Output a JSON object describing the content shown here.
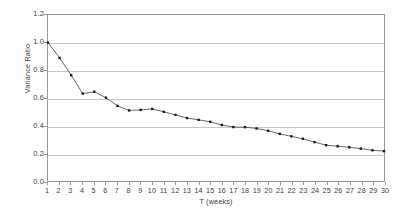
{
  "chart_data": {
    "type": "line",
    "title": "",
    "xlabel": "T (weeks)",
    "ylabel": "Variance Ratio",
    "xlim": [
      1,
      30
    ],
    "ylim": [
      0.0,
      1.2
    ],
    "grid": true,
    "legend": "none",
    "marker": "square",
    "x_tick_labels": [
      "1",
      "2",
      "3",
      "4",
      "5",
      "6",
      "7",
      "8",
      "9",
      "10",
      "11",
      "12",
      "13",
      "14",
      "15",
      "16",
      "17",
      "18",
      "19",
      "20",
      "21",
      "22",
      "23",
      "24",
      "25",
      "26",
      "27",
      "28",
      "29",
      "30"
    ],
    "y_tick_labels": [
      "0.0",
      "0.2",
      "0.4",
      "0.6",
      "0.8",
      "1.0",
      "1.2"
    ],
    "y_tick_values": [
      0.0,
      0.2,
      0.4,
      0.6,
      0.8,
      1.0,
      1.2
    ],
    "x": [
      1,
      2,
      3,
      4,
      5,
      6,
      7,
      8,
      9,
      10,
      11,
      12,
      13,
      14,
      15,
      16,
      17,
      18,
      19,
      20,
      21,
      22,
      23,
      24,
      25,
      26,
      27,
      28,
      29,
      30
    ],
    "values": [
      1.0,
      0.89,
      0.765,
      0.632,
      0.645,
      0.602,
      0.543,
      0.51,
      0.514,
      0.521,
      0.5,
      0.478,
      0.455,
      0.442,
      0.428,
      0.405,
      0.39,
      0.389,
      0.38,
      0.363,
      0.341,
      0.323,
      0.305,
      0.281,
      0.259,
      0.251,
      0.244,
      0.234,
      0.222,
      0.216
    ],
    "series_name": "Variance Ratio",
    "line_color": "#404040",
    "marker_color": "#1a1a1a",
    "grid_color": "#c9c9c9",
    "axis_color": "#9a9a9a",
    "background": "#ffffff"
  }
}
